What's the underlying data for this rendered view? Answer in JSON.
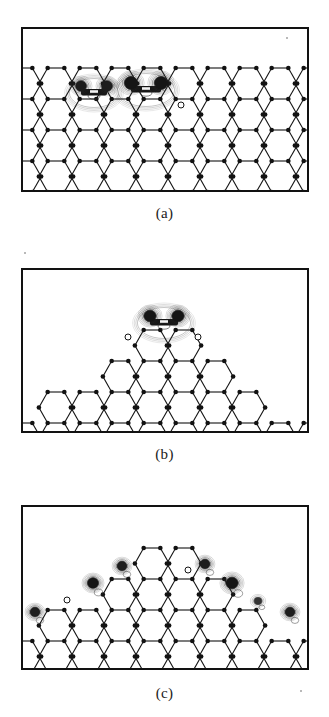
{
  "figure": {
    "kind": "contour-plot-panels",
    "background": "#ffffff",
    "line_color": "#121212",
    "panel_count": 3
  },
  "panels": [
    {
      "id": "a",
      "label": "(a)",
      "frame": {
        "x": 21,
        "y": 27,
        "w": 288,
        "h": 165
      },
      "label_y": 205,
      "description": "flat honeycomb substrate with two adsorbed molecules",
      "substrate": {
        "type": "honeycomb-lattice",
        "profile": "flat",
        "rows": 4,
        "columns": 9,
        "cell_w": 32,
        "cell_h": 31,
        "origin_x": 24,
        "top_y": 68
      },
      "adsorbates": [
        {
          "name": "molecule-left",
          "cx": 94,
          "cy": 88,
          "lobes": 2,
          "lobe_dx": 13,
          "lobe_ry": 9,
          "lobe_rx": 10,
          "rings": 5,
          "intensity": "medium"
        },
        {
          "name": "molecule-center",
          "cx": 146,
          "cy": 85,
          "lobes": 2,
          "lobe_dx": 15,
          "lobe_ry": 11,
          "lobe_rx": 12,
          "rings": 6,
          "intensity": "high"
        }
      ],
      "open_sites": [
        {
          "name": "open-site-1",
          "cx": 181,
          "cy": 105,
          "r": 3
        }
      ]
    },
    {
      "id": "b",
      "label": "(b)",
      "frame": {
        "x": 21,
        "y": 268,
        "w": 288,
        "h": 165
      },
      "label_y": 446,
      "description": "terraced pyramid island with single molecule at the apex",
      "substrate": {
        "type": "honeycomb-lattice",
        "profile": "pyramid",
        "rows": 5,
        "columns": 9,
        "cell_w": 32,
        "cell_h": 31,
        "origin_x": 24,
        "apex_x": 164,
        "top_y": 330
      },
      "adsorbates": [
        {
          "name": "molecule-apex",
          "cx": 164,
          "cy": 318,
          "lobes": 2,
          "lobe_dx": 14,
          "lobe_ry": 10,
          "lobe_rx": 11,
          "rings": 6,
          "intensity": "high"
        }
      ],
      "open_sites": [
        {
          "name": "open-site-left",
          "cx": 128,
          "cy": 337,
          "r": 3
        },
        {
          "name": "open-site-right",
          "cx": 198,
          "cy": 337,
          "r": 3
        }
      ]
    },
    {
      "id": "c",
      "label": "(c)",
      "frame": {
        "x": 21,
        "y": 505,
        "w": 288,
        "h": 165
      },
      "label_y": 685,
      "description": "terraced pyramid island with several single-atom adsorbates along the step edges",
      "substrate": {
        "type": "honeycomb-lattice",
        "profile": "pyramid",
        "rows": 5,
        "columns": 9,
        "cell_w": 32,
        "cell_h": 31,
        "origin_x": 24,
        "apex_x": 164,
        "top_y": 548
      },
      "adsorbates": [
        {
          "name": "atom-far-left",
          "cx": 35,
          "cy": 612,
          "lobes": 1,
          "lobe_rx": 9,
          "lobe_ry": 8,
          "rings": 5,
          "intensity": "medium"
        },
        {
          "name": "atom-left-step",
          "cx": 93,
          "cy": 583,
          "lobes": 1,
          "lobe_rx": 10,
          "lobe_ry": 9,
          "rings": 6,
          "intensity": "high"
        },
        {
          "name": "atom-left-upper",
          "cx": 122,
          "cy": 566,
          "lobes": 1,
          "lobe_rx": 9,
          "lobe_ry": 8,
          "rings": 5,
          "intensity": "medium"
        },
        {
          "name": "atom-right-upper",
          "cx": 205,
          "cy": 564,
          "lobes": 1,
          "lobe_rx": 9,
          "lobe_ry": 8,
          "rings": 5,
          "intensity": "medium"
        },
        {
          "name": "atom-right-step",
          "cx": 232,
          "cy": 583,
          "lobes": 1,
          "lobe_rx": 11,
          "lobe_ry": 10,
          "rings": 6,
          "intensity": "high"
        },
        {
          "name": "atom-right-lower",
          "cx": 258,
          "cy": 601,
          "lobes": 1,
          "lobe_rx": 7,
          "lobe_ry": 6,
          "rings": 3,
          "intensity": "low"
        },
        {
          "name": "atom-far-right",
          "cx": 290,
          "cy": 612,
          "lobes": 1,
          "lobe_rx": 9,
          "lobe_ry": 8,
          "rings": 5,
          "intensity": "medium"
        }
      ],
      "open_sites": [
        {
          "name": "open-site-left",
          "cx": 67,
          "cy": 600,
          "r": 3
        },
        {
          "name": "open-site-mid",
          "cx": 188,
          "cy": 570,
          "r": 3
        }
      ]
    }
  ]
}
